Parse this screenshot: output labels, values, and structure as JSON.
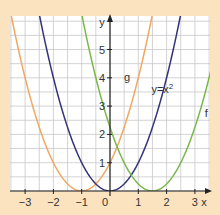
{
  "chart_data": {
    "type": "line",
    "title": "",
    "xlabel": "x",
    "ylabel": "y",
    "xlim": [
      -3.5,
      3.5
    ],
    "ylim": [
      0,
      6.2
    ],
    "grid": true,
    "grid_step": 0.5,
    "x_ticks": [
      "-3",
      "-2",
      "-1",
      "0",
      "1",
      "2",
      "3"
    ],
    "y_ticks": [
      "1",
      "2",
      "3",
      "4",
      "5"
    ],
    "series": [
      {
        "name": "g",
        "formula": "(x+1)^2",
        "h": -1,
        "color": "#f0a860",
        "label_pos": [
          0.6,
          3.9
        ]
      },
      {
        "name": "y=x²",
        "formula": "x^2",
        "h": 0,
        "color": "#33337a",
        "label_pos": [
          1.85,
          3.45
        ]
      },
      {
        "name": "f",
        "formula": "(x-1.5)^2",
        "h": 1.5,
        "color": "#7ab84a",
        "label_pos": [
          3.4,
          2.6
        ]
      }
    ],
    "background": "#fce3c0"
  }
}
